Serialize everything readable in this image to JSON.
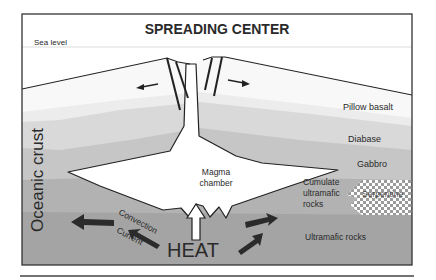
{
  "title": "SPREADING CENTER",
  "sea_level_label": "Sea level",
  "side_label": "Oceanic crust",
  "magma_chamber": [
    "Magma",
    "chamber"
  ],
  "convection": [
    "Convection",
    "Current"
  ],
  "heat_label": "HEAT",
  "layers": {
    "pillow_basalt": "Pillow basalt",
    "diabase": "Diabase",
    "gabbro": "Gabbro",
    "cumulate": [
      "Cumulate",
      "ultramafic",
      "rocks"
    ],
    "serpentine": "Serpentine",
    "ultramafic": "Ultramafic rocks"
  },
  "colors": {
    "frame": "#333333",
    "water": "#ffffff",
    "pillow": "#eeeeee",
    "diabase": "#dcdcdc",
    "gabbro": "#c8c8c8",
    "cumulate": "#b4b4b4",
    "ultramafic": "#a4a4a4",
    "arrow": "#2b2b2b"
  }
}
